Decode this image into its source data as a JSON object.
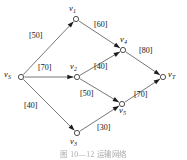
{
  "figure": {
    "caption": "图 10—12  运输网络",
    "background_color": "#ffffff",
    "node_stroke_color": "#3a3a3a",
    "edge_color": "#4a4a4a",
    "label_color": "#121212"
  },
  "chart_data": {
    "type": "diagram",
    "title": "图 10—12  运输网络",
    "subtitle": "",
    "xlabel": "",
    "ylabel": "",
    "grid": false,
    "legend_position": "none",
    "diagram_kind": "directed-network-flow-graph",
    "nodes": [
      {
        "id": "vS",
        "label_main": "v",
        "label_sub": "S",
        "x": 21,
        "y": 77,
        "label_x": 4,
        "label_y": 70
      },
      {
        "id": "v1",
        "label_main": "v",
        "label_sub": "1",
        "x": 76,
        "y": 19,
        "label_x": 69,
        "label_y": 4
      },
      {
        "id": "v2",
        "label_main": "v",
        "label_sub": "2",
        "x": 77,
        "y": 77,
        "label_x": 70,
        "label_y": 62
      },
      {
        "id": "v3",
        "label_main": "v",
        "label_sub": "3",
        "x": 77,
        "y": 133,
        "label_x": 70,
        "label_y": 137
      },
      {
        "id": "v4",
        "label_main": "v",
        "label_sub": "4",
        "x": 123,
        "y": 50,
        "label_x": 120,
        "label_y": 35
      },
      {
        "id": "v5",
        "label_main": "v",
        "label_sub": "5",
        "x": 122,
        "y": 104,
        "label_x": 119,
        "label_y": 106
      },
      {
        "id": "vT",
        "label_main": "v",
        "label_sub": "T",
        "x": 163,
        "y": 77,
        "label_x": 168,
        "label_y": 70
      }
    ],
    "edges": [
      {
        "from": "vS",
        "to": "v1",
        "capacity": 50,
        "label": "[50]",
        "label_x": 29,
        "label_y": 32
      },
      {
        "from": "vS",
        "to": "v2",
        "capacity": 70,
        "label": "[70]",
        "label_x": 38,
        "label_y": 64
      },
      {
        "from": "vS",
        "to": "v3",
        "capacity": 40,
        "label": "[40]",
        "label_x": 24,
        "label_y": 102
      },
      {
        "from": "v1",
        "to": "v4",
        "capacity": 60,
        "label": "[60]",
        "label_x": 94,
        "label_y": 21
      },
      {
        "from": "v2",
        "to": "v4",
        "capacity": 40,
        "label": "[40]",
        "label_x": 94,
        "label_y": 63
      },
      {
        "from": "v2",
        "to": "v5",
        "capacity": 50,
        "label": "[50]",
        "label_x": 80,
        "label_y": 90
      },
      {
        "from": "v3",
        "to": "v5",
        "capacity": 30,
        "label": "[30]",
        "label_x": 97,
        "label_y": 124
      },
      {
        "from": "v4",
        "to": "vT",
        "capacity": 80,
        "label": "[80]",
        "label_x": 139,
        "label_y": 47
      },
      {
        "from": "v5",
        "to": "vT",
        "capacity": 70,
        "label": "[70]",
        "label_x": 134,
        "label_y": 91
      }
    ],
    "node_radius": 2.6
  }
}
